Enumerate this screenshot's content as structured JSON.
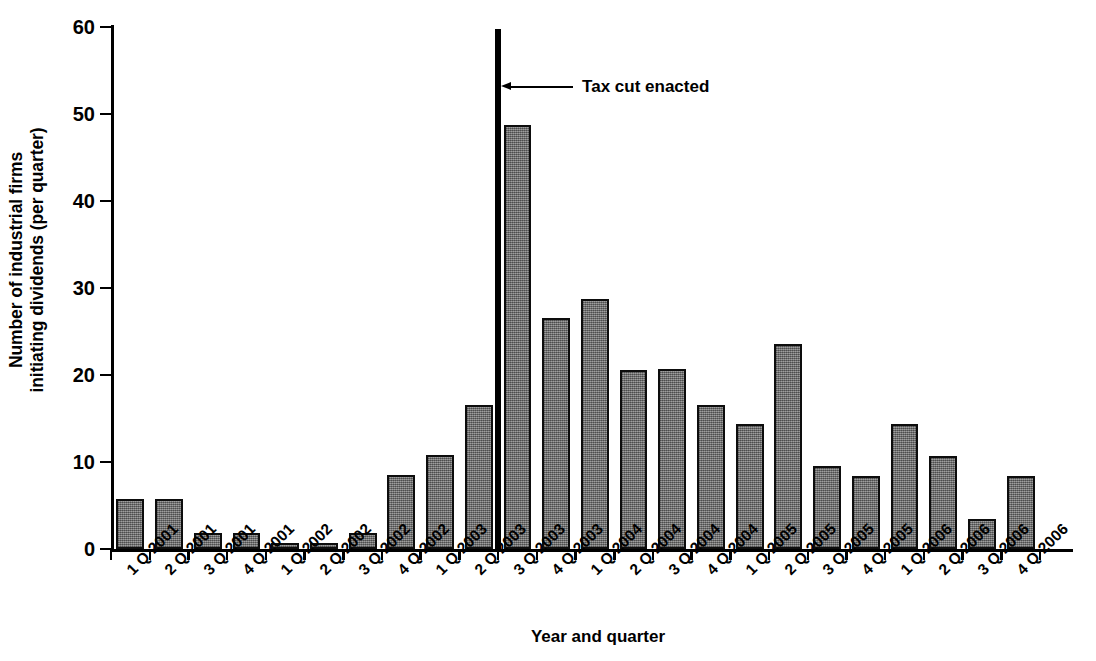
{
  "chart_data": {
    "type": "bar",
    "title": "",
    "xlabel": "Year and quarter",
    "ylabel": "Number of industrial firms initiating dividends (per quarter)",
    "ylabel_line1": "Number of industrial firms",
    "ylabel_line2": "initiating dividends (per quarter)",
    "ylim": [
      0,
      60
    ],
    "ytick_values": [
      0,
      10,
      20,
      30,
      40,
      50,
      60
    ],
    "ytick_labels": [
      "0",
      "10",
      "20",
      "30",
      "40",
      "50",
      "60"
    ],
    "grid": false,
    "legend": null,
    "bar_color": "#767676",
    "bar_edge_color": "#0d0d0d",
    "categories": [
      "1 Q 2001",
      "2 Q 2001",
      "3 Q 2001",
      "4 Q 2001",
      "1 Q 2002",
      "2 Q 2002",
      "3 Q 2002",
      "4 Q 2002",
      "1 Q 2003",
      "2 Q 2003",
      "3 Q 2003",
      "4 Q 2003",
      "1 Q 2004",
      "2 Q 2004",
      "3 Q 2004",
      "4 Q 2004",
      "1 Q 2005",
      "2 Q 2005",
      "3 Q 2005",
      "4 Q 2005",
      "1 Q 2006",
      "2 Q 2006",
      "3 Q 2006",
      "4 Q 2006"
    ],
    "values": [
      5.7,
      5.7,
      1.8,
      1.8,
      0.7,
      0.7,
      1.8,
      8.5,
      10.8,
      16.6,
      48.7,
      26.5,
      28.7,
      20.6,
      20.7,
      16.5,
      14.4,
      23.6,
      9.5,
      8.4,
      14.4,
      10.7,
      3.4,
      8.4
    ],
    "annotations": [
      {
        "label": "Tax cut enacted",
        "type": "vertical-line-with-arrow",
        "at_category_boundary": "between 2 Q 2003 and 3 Q 2003",
        "line_color": "#000000"
      }
    ]
  }
}
